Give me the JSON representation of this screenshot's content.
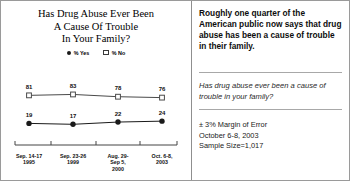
{
  "chart_data": {
    "type": "line",
    "title": "Has Drug Abuse Ever Been A Cause Of Trouble In Your Family?",
    "title_lines": [
      "Has Drug Abuse Ever Been",
      "A Cause Of Trouble",
      "In Your Family?"
    ],
    "categories": [
      "Sep. 14-17 1995",
      "Sep. 23-26 1999",
      "Aug. 29-Sep 5, 2000",
      "Oct. 6-8, 2003"
    ],
    "category_lines": [
      [
        "Sep. 14-17",
        "1995"
      ],
      [
        "Sep. 23-26",
        "1999"
      ],
      [
        "Aug. 29-",
        "Sep 5,",
        "2000"
      ],
      [
        "Oct. 6-8,",
        "2003"
      ]
    ],
    "series": [
      {
        "name": "% No",
        "values": [
          81,
          83,
          78,
          76
        ],
        "marker": "hollow-square",
        "color": "#4a4a4a"
      },
      {
        "name": "% Yes",
        "values": [
          19,
          17,
          22,
          24
        ],
        "marker": "filled-circle",
        "color": "#1a1a1a"
      }
    ],
    "legend": [
      "% Yes",
      "% No"
    ],
    "legend_position": "top-center",
    "ylim": [
      0,
      100
    ],
    "xlabel": "",
    "ylabel": "",
    "grid": false,
    "axis_line": "bottom-with-ticks"
  },
  "headline": {
    "text": "Roughly one quarter of the American public now says that drug abuse has been a cause of trouble in their family."
  },
  "poll_question": {
    "text": "Has drug abuse ever been a cause of trouble in your family?"
  },
  "footer": {
    "margin_of_error": "± 3% Margin of Error",
    "field_dates": "October 6-8, 2003",
    "sample_size": "Sample Size=1,017"
  }
}
